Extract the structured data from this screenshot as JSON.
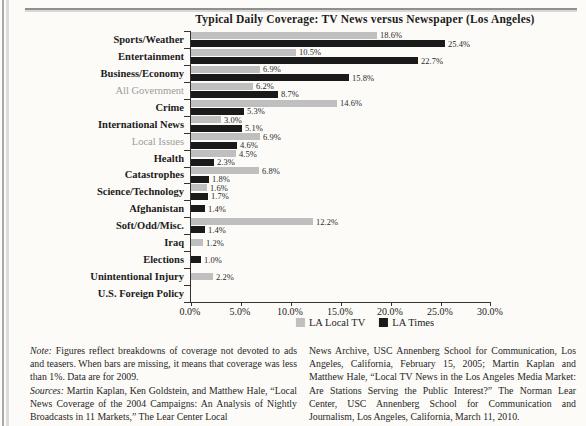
{
  "chart_data": {
    "type": "bar",
    "orientation": "horizontal",
    "title": "Typical Daily Coverage: TV News versus Newspaper (Los Angeles)",
    "categories": [
      "Sports/Weather",
      "Entertainment",
      "Business/Economy",
      "All Government",
      "Crime",
      "International News",
      "Local Issues",
      "Health",
      "Catastrophes",
      "Science/Technology",
      "Afghanistan",
      "Soft/Odd/Misc.",
      "Iraq",
      "Elections",
      "Unintentional Injury",
      "U.S. Foreign Policy"
    ],
    "muted_categories": [
      "All Government",
      "Local Issues"
    ],
    "series": [
      {
        "name": "LA Local TV",
        "color": "#bfbfbf",
        "values": [
          18.6,
          10.5,
          6.9,
          6.2,
          14.6,
          3.0,
          6.9,
          4.5,
          6.8,
          1.6,
          null,
          12.2,
          1.2,
          null,
          2.2,
          null
        ]
      },
      {
        "name": "LA Times",
        "color": "#1a1a1a",
        "values": [
          25.4,
          22.7,
          15.8,
          8.7,
          5.3,
          5.1,
          4.6,
          2.3,
          1.8,
          1.7,
          1.4,
          1.4,
          null,
          1.0,
          null,
          null
        ]
      }
    ],
    "xlim": [
      0,
      30
    ],
    "x_ticks": [
      0,
      5,
      10,
      15,
      20,
      25,
      30
    ],
    "x_tick_labels": [
      "0.0%",
      "5.0%",
      "10.0%",
      "15.0%",
      "20.0%",
      "25.0%",
      "30.0%"
    ],
    "value_label_suffix": "%",
    "legend_position": "bottom",
    "grid": false
  },
  "notes": {
    "note_label": "Note:",
    "note_text": " Figures reflect breakdowns of coverage not devoted to ads and teasers. When bars are missing, it means that coverage was less than 1%. Data are for 2009.",
    "sources_label": "Sources:",
    "sources_text": " Martin Kaplan, Ken Goldstein, and Matthew Hale, “Local News Coverage of the 2004 Campaigns: An Analysis of Nightly Broadcasts in 11 Markets,” The Lear Center Local",
    "right_column": "News Archive, USC Annenberg School for Communication, Los Angeles, California, February 15, 2005; Martin Kaplan and Matthew Hale, “Local TV News in the Los Angeles Media Market: Are Stations Serving the Public Interest?” The Norman Lear Center, USC Annenberg School for Communication and Journalism, Los Angeles, California, March 11, 2010."
  }
}
